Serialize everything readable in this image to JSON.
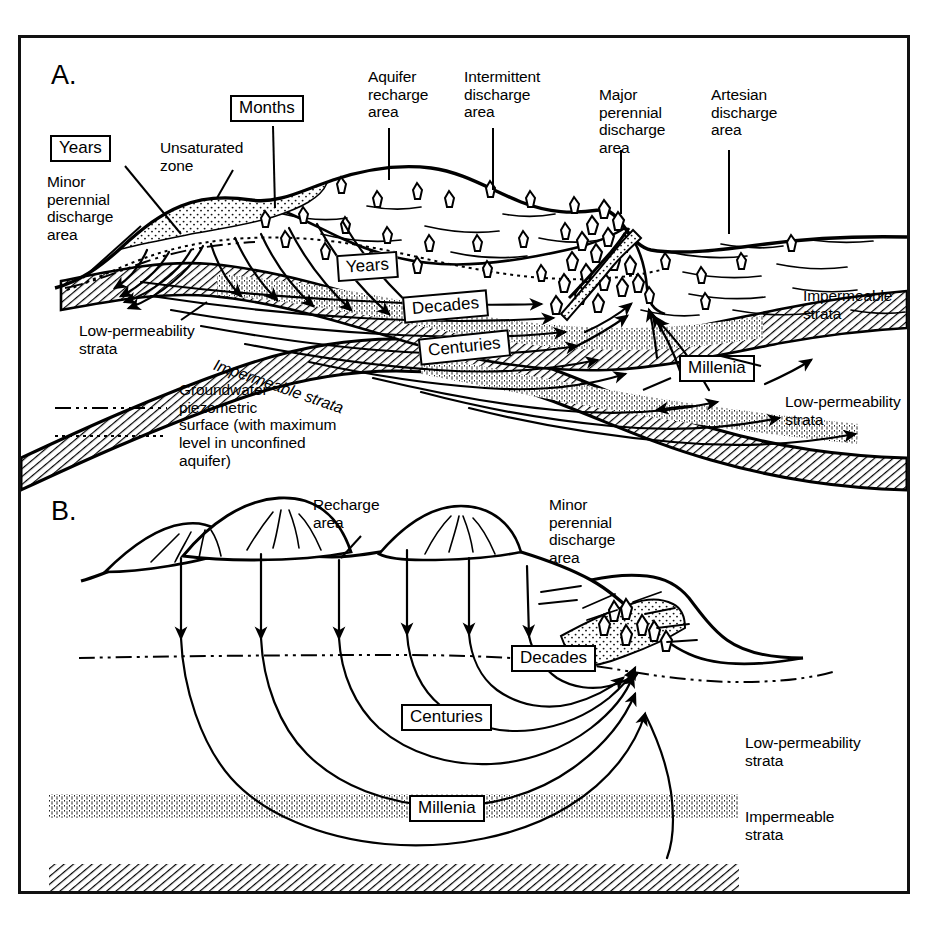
{
  "figure": {
    "type": "hydrogeology-cross-section-diagram",
    "panels": [
      {
        "id": "A",
        "letter": "A.",
        "description": "Regional groundwater flow system cross-section showing recharge and discharge areas with residence time zones",
        "surface_labels": [
          {
            "name": "minor-perennial-discharge-area",
            "text": "Minor\nperennial\ndischarge\narea",
            "x": 26,
            "y": 135
          },
          {
            "name": "unsaturated-zone",
            "text": "Unsaturated\nzone",
            "x": 139,
            "y": 101
          },
          {
            "name": "aquifer-recharge-area",
            "text": "Aquifer\nrecharge\narea",
            "x": 347,
            "y": 59
          },
          {
            "name": "intermittent-discharge-area",
            "text": "Intermittent\ndischarge\narea",
            "x": 443,
            "y": 58
          },
          {
            "name": "major-perennial-discharge-area",
            "text": "Major\nperennial\ndischarge\narea",
            "x": 594,
            "y": 85
          },
          {
            "name": "artesian-discharge-area",
            "text": "Artesian\ndischarge\narea",
            "x": 705,
            "y": 86
          },
          {
            "name": "low-permeability-strata-left",
            "text": "Low-permeability\nstrata",
            "x": 80,
            "y": 315
          },
          {
            "name": "impermeable-strata-right",
            "text": "Impermeable\nstrata",
            "x": 790,
            "y": 279
          },
          {
            "name": "low-permeability-strata-right",
            "text": "Low-permeability\nstrata",
            "x": 760,
            "y": 388
          }
        ],
        "diagonal_labels": [
          {
            "name": "impermeable-strata-diagonal",
            "text": "Impermeable strata",
            "x": 210,
            "y": 340,
            "rotation": 18
          }
        ],
        "time_boxes": [
          {
            "name": "time-box-years-upper",
            "text": "Years",
            "x": 47,
            "y": 125
          },
          {
            "name": "time-box-months",
            "text": "Months",
            "x": 227,
            "y": 82
          },
          {
            "name": "time-box-years-lower",
            "text": "Years",
            "x": 334,
            "y": 246
          },
          {
            "name": "time-box-decades",
            "text": "Decades",
            "x": 400,
            "y": 287
          },
          {
            "name": "time-box-centuries",
            "text": "Centuries",
            "x": 418,
            "y": 329
          },
          {
            "name": "time-box-millenia",
            "text": "Millenia",
            "x": 675,
            "y": 350
          }
        ],
        "legend": {
          "entries": [
            {
              "name": "legend-piezometric-surface",
              "style": "dash-dot-dot",
              "text": "Groundwater\npiezometric\nsurface (with maximum"
            },
            {
              "name": "legend-unconfined-max-level",
              "style": "dotted",
              "text": "level in unconfined\naquifer)"
            }
          ]
        }
      },
      {
        "id": "B",
        "letter": "B.",
        "description": "Local groundwater flow system cross-section with recharge area and minor perennial discharge area",
        "surface_labels": [
          {
            "name": "recharge-area",
            "text": "Recharge\narea",
            "x": 310,
            "y": 492
          },
          {
            "name": "minor-perennial-discharge-area-b",
            "text": "Minor\nperennial\ndischarge\narea",
            "x": 545,
            "y": 492
          },
          {
            "name": "low-permeability-strata-b",
            "text": "Low-permeability\nstrata",
            "x": 742,
            "y": 732
          },
          {
            "name": "impermeable-strata-b",
            "text": "Impermeable\nstrata",
            "x": 742,
            "y": 806
          }
        ],
        "time_boxes": [
          {
            "name": "time-box-decades-b",
            "text": "Decades",
            "x": 508,
            "y": 640
          },
          {
            "name": "time-box-centuries-b",
            "text": "Centuries",
            "x": 398,
            "y": 698
          },
          {
            "name": "time-box-millenia-b",
            "text": "Millenia",
            "x": 405,
            "y": 790
          }
        ]
      }
    ],
    "colors": {
      "ink": "#000000",
      "background": "#ffffff",
      "hatch": "#222222",
      "stipple": "#333333"
    }
  }
}
